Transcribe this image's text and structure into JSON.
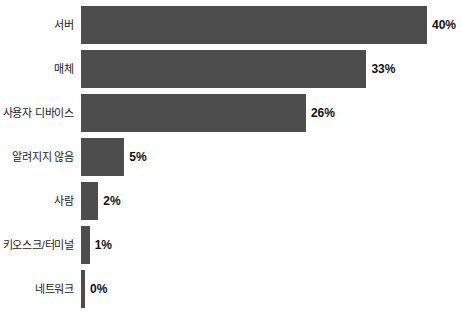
{
  "chart_data": {
    "type": "bar",
    "orientation": "horizontal",
    "title": "",
    "subtitle": "",
    "xlabel": "",
    "ylabel": "",
    "xlim": [
      0,
      40
    ],
    "grid": false,
    "legend": false,
    "bar_color": "#4d4d4d",
    "background_color": "#ffffff",
    "value_suffix": "%",
    "categories": [
      "서버",
      "매체",
      "사용자 디바이스",
      "알려지지 않음",
      "사람",
      "키오스크/터미널",
      "네트워크"
    ],
    "values": [
      40,
      33,
      26,
      5,
      2,
      1,
      0
    ],
    "value_labels": [
      "40%",
      "33%",
      "26%",
      "5%",
      "2%",
      "1%",
      "0%"
    ],
    "bars": [
      {
        "label": "서버",
        "value": 40,
        "value_label": "40%"
      },
      {
        "label": "매체",
        "value": 33,
        "value_label": "33%"
      },
      {
        "label": "사용자 디바이스",
        "value": 26,
        "value_label": "26%"
      },
      {
        "label": "알려지지 않음",
        "value": 5,
        "value_label": "5%"
      },
      {
        "label": "사람",
        "value": 2,
        "value_label": "2%"
      },
      {
        "label": "키오스크/터미널",
        "value": 1,
        "value_label": "1%"
      },
      {
        "label": "네트워크",
        "value": 0,
        "value_label": "0%"
      }
    ]
  }
}
